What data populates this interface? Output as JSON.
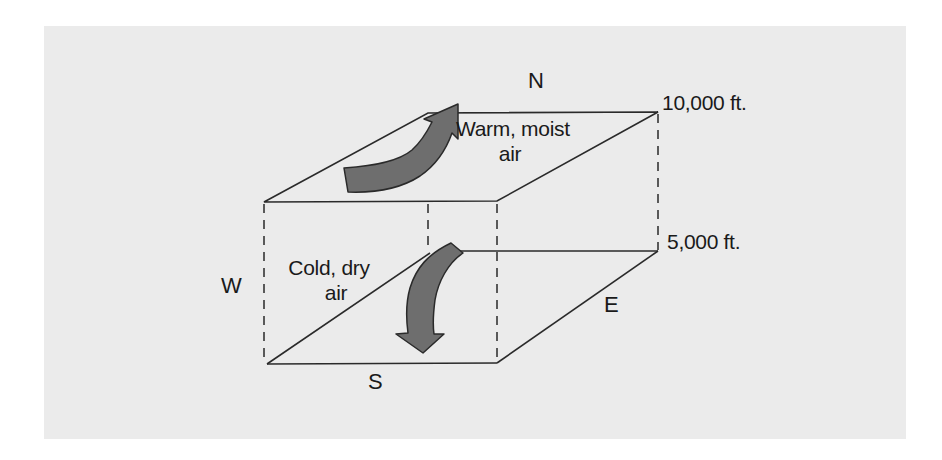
{
  "diagram": {
    "title": "",
    "colors": {
      "background": "#ffffff",
      "panel": "#ebebeb",
      "lines": "#2a2a2a",
      "arrow_fill": "#6e6e6e",
      "arrow_stroke": "#2a2a2a",
      "text": "#1a1a1a"
    },
    "directions": {
      "north": "N",
      "south": "S",
      "east": "E",
      "west": "W"
    },
    "altitudes": {
      "upper": "10,000 ft.",
      "lower": "5,000 ft."
    },
    "air_masses": {
      "upper": {
        "line1": "Warm, moist",
        "line2": "air",
        "arrow": "curved-arrow-up-right"
      },
      "lower": {
        "line1": "Cold, dry",
        "line2": "air",
        "arrow": "curved-arrow-down"
      }
    }
  }
}
